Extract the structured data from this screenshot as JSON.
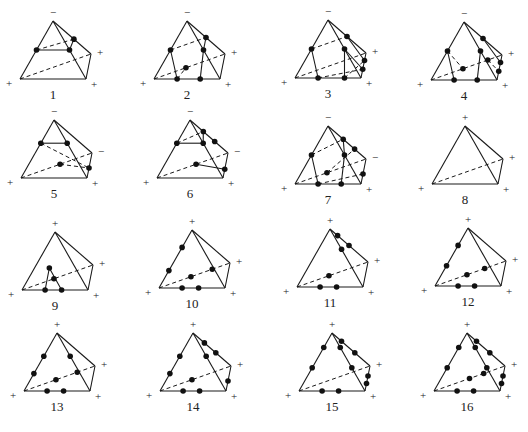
{
  "figure": {
    "colors": {
      "line": "#1a1a1a",
      "dot": "#111111",
      "background": "#ffffff"
    },
    "template": {
      "A_apex": [
        0,
        0
      ],
      "B_back_right": [
        38,
        33
      ],
      "C_front_right": [
        33,
        58
      ],
      "D_front_left": [
        -33,
        58
      ],
      "label_offset": [
        0,
        78
      ]
    },
    "cases": [
      {
        "id": "1",
        "apex": [
          53,
          21
        ],
        "signs": {
          "A": "−",
          "B": "+",
          "C": "+",
          "D": "+"
        }
      },
      {
        "id": "2",
        "apex": [
          187,
          21
        ],
        "signs": {
          "A": "−",
          "B": "+",
          "C": "+",
          "D": "+"
        }
      },
      {
        "id": "3",
        "apex": [
          328,
          20
        ],
        "signs": {
          "A": "−",
          "B": "+",
          "C": "+",
          "D": "+"
        }
      },
      {
        "id": "4",
        "apex": [
          464,
          22
        ],
        "signs": {
          "A": "−",
          "B": "+",
          "C": "+",
          "D": "+"
        }
      },
      {
        "id": "5",
        "apex": [
          54,
          120
        ],
        "signs": {
          "A": "−",
          "B": "−",
          "C": "+",
          "D": "+"
        }
      },
      {
        "id": "6",
        "apex": [
          190,
          120
        ],
        "signs": {
          "A": "−",
          "B": "−",
          "C": "+",
          "D": "+"
        }
      },
      {
        "id": "7",
        "apex": [
          328,
          126
        ],
        "signs": {
          "A": "−",
          "B": "−",
          "C": "+",
          "D": "+"
        }
      },
      {
        "id": "8",
        "apex": [
          465,
          126
        ],
        "signs": {
          "A": "+",
          "B": "+",
          "C": "+",
          "D": "+"
        }
      },
      {
        "id": "9",
        "apex": [
          55,
          232
        ],
        "signs": {
          "A": "+",
          "B": "+",
          "C": "+",
          "D": "+"
        }
      },
      {
        "id": "10",
        "apex": [
          192,
          230
        ],
        "signs": {
          "A": "+",
          "B": "+",
          "C": "+",
          "D": "+"
        }
      },
      {
        "id": "11",
        "apex": [
          330,
          229
        ],
        "signs": {
          "A": "+",
          "B": "+",
          "C": "+",
          "D": "+"
        }
      },
      {
        "id": "12",
        "apex": [
          468,
          228
        ],
        "signs": {
          "A": "+",
          "B": "+",
          "C": "+",
          "D": "+"
        }
      },
      {
        "id": "13",
        "apex": [
          57,
          333
        ],
        "signs": {
          "A": "+",
          "B": "+",
          "C": "+",
          "D": "+"
        }
      },
      {
        "id": "14",
        "apex": [
          193,
          333
        ],
        "signs": {
          "A": "+",
          "B": "+",
          "C": "+",
          "D": "+"
        }
      },
      {
        "id": "15",
        "apex": [
          332,
          333
        ],
        "signs": {
          "A": "+",
          "B": "+",
          "C": "+",
          "D": "+"
        }
      },
      {
        "id": "16",
        "apex": [
          467,
          333
        ],
        "signs": {
          "A": "+",
          "B": "+",
          "C": "+",
          "D": "+"
        }
      }
    ]
  }
}
